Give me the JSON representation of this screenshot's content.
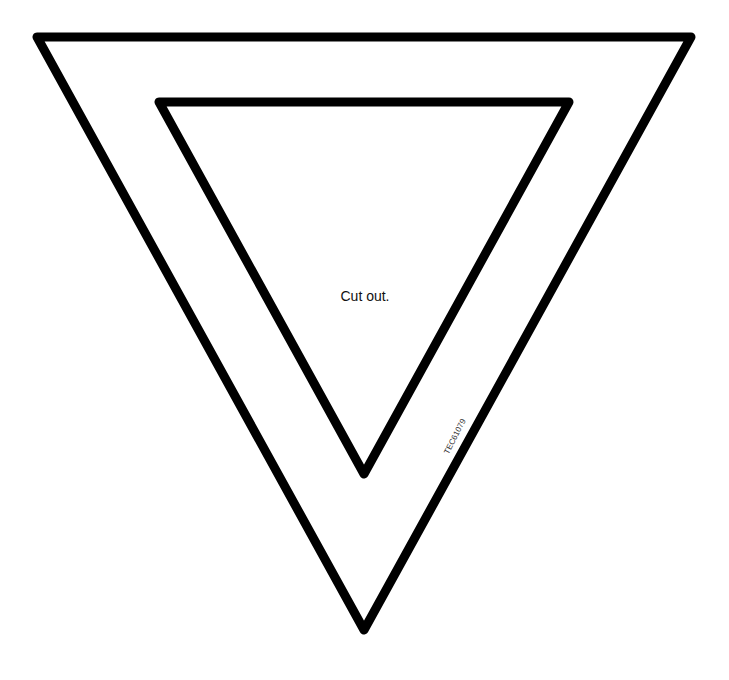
{
  "diagram": {
    "instruction_label": "Cut out.",
    "product_code": "TEC61079",
    "stroke_color": "#000000",
    "background_color": "#ffffff",
    "outer_triangle": {
      "points": [
        [
          37,
          37
        ],
        [
          691,
          37
        ],
        [
          364,
          630
        ]
      ],
      "stroke_width": 9
    },
    "inner_triangle": {
      "points": [
        [
          159,
          102
        ],
        [
          569,
          102
        ],
        [
          364,
          474
        ]
      ],
      "stroke_width": 9
    }
  }
}
